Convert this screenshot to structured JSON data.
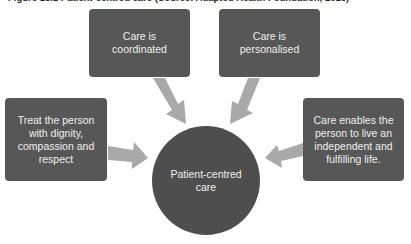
{
  "caption": "Figure 13.1   Patient-centred care (Source: Adapted Health Foundation, 2016)",
  "center": {
    "label": "Patient-centred\ncare"
  },
  "boxes": [
    {
      "id": "coordinated",
      "label": "Care is\ncoordinated"
    },
    {
      "id": "personalised",
      "label": "Care is\npersonalised"
    },
    {
      "id": "dignity",
      "label": "Treat the person\nwith dignity,\ncompassion and\nrespect"
    },
    {
      "id": "independent",
      "label": "Care enables the\nperson to live an\nindependent and\nfulfilling life."
    }
  ],
  "colors": {
    "box": "#575757",
    "circle": "#4e4e4e",
    "arrow": "#a9a9a9",
    "text": "#f0f0f0"
  }
}
